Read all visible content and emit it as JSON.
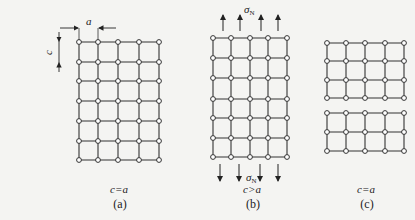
{
  "figure": {
    "panels": [
      {
        "id": "a",
        "caption": "(a)",
        "relation": "c=a",
        "dimension_labels": {
          "horizontal": "a",
          "vertical": "c"
        },
        "grid": {
          "columns": 5,
          "rows": 7,
          "x": [
            79,
            98,
            118,
            139,
            159
          ],
          "y": [
            42,
            62,
            81,
            101,
            121,
            141,
            160
          ]
        }
      },
      {
        "id": "b",
        "caption": "(b)",
        "relation": "c>a",
        "stress_label_top": "σ",
        "stress_label_bottom": "σ",
        "stress_subscript": "N",
        "grid": {
          "columns": 5,
          "rows": 7,
          "x": [
            213,
            231,
            250,
            268,
            287
          ],
          "y": [
            38,
            58,
            78,
            99,
            118,
            138,
            157
          ]
        },
        "arrows_top_x": [
          223,
          240,
          261,
          278
        ],
        "arrows_bottom_x": [
          220,
          239,
          260,
          278
        ]
      },
      {
        "id": "c",
        "caption": "(c)",
        "relation": "c=a",
        "grid_upper": {
          "columns": 5,
          "rows": 4,
          "x": [
            327,
            346,
            365,
            385,
            404
          ],
          "y": [
            43,
            61,
            80,
            98
          ]
        },
        "grid_lower": {
          "columns": 5,
          "rows": 3,
          "x": [
            327,
            346,
            365,
            385,
            404
          ],
          "y": [
            113,
            132,
            151
          ]
        }
      }
    ],
    "colors": {
      "line": "#333333",
      "node_fill": "#ffffff",
      "background": "#f4f4f2"
    }
  }
}
